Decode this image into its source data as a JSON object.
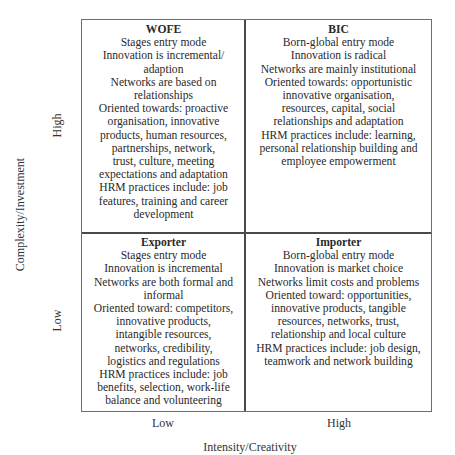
{
  "axes": {
    "y_title": "Complexity/Investment",
    "y_high": "High",
    "y_low": "Low",
    "x_title": "Intensity/Creativity",
    "x_low": "Low",
    "x_high": "High"
  },
  "quadrants": {
    "top_left": {
      "title": "WOFE",
      "lines": [
        "Stages entry mode",
        "Innovation is incremental/",
        "adaption",
        "Networks are based on",
        "relationships",
        "Oriented towards: proactive",
        "organisation, innovative",
        "products, human resources,",
        "partnerships, network,",
        "trust, culture, meeting",
        "expectations and adaptation",
        "HRM practices include: job",
        "features, training and career",
        "development"
      ]
    },
    "top_right": {
      "title": "BIC",
      "lines": [
        "Born-global entry mode",
        "Innovation is radical",
        "Networks are mainly institutional",
        "Oriented towards: opportunistic",
        "innovative organisation,",
        "resources, capital, social",
        "relationships and adaptation",
        "HRM practices include: learning,",
        "personal relationship building and",
        "employee empowerment"
      ]
    },
    "bottom_left": {
      "title": "Exporter",
      "lines": [
        "Stages entry mode",
        "Innovation is incremental",
        "Networks are both formal and",
        "informal",
        "Oriented toward: competitors,",
        "innovative products,",
        "intangible resources,",
        "networks, credibility,",
        "logistics and regulations",
        "HRM practices include: job",
        "benefits, selection, work-life",
        "balance and volunteering"
      ]
    },
    "bottom_right": {
      "title": "Importer",
      "lines": [
        "Born-global entry mode",
        "Innovation is market choice",
        "Networks limit costs and problems",
        "Oriented toward: opportunities,",
        "innovative products, tangible",
        "resources, networks, trust,",
        "relationship and local culture",
        "HRM practices include: job design,",
        "teamwork and network building"
      ]
    }
  }
}
